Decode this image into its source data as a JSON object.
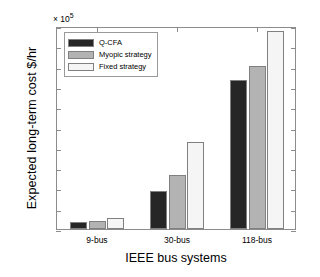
{
  "chart_data": {
    "type": "bar",
    "title": "",
    "xlabel": "IEEE bus systems",
    "ylabel": "Expected long-term cost $/hr",
    "y_exponent_label": "× 10",
    "y_exponent_value": "5",
    "y_scale_factor": 100000,
    "categories": [
      "9-bus",
      "30-bus",
      "118-bus"
    ],
    "ylim": [
      0,
      2
    ],
    "yticks": [
      0,
      0.2,
      0.4,
      0.6,
      0.8,
      1,
      1.2,
      1.4,
      1.6,
      1.8,
      2
    ],
    "ytick_labels": [
      "0",
      "0.2",
      "0.4",
      "0.6",
      "0.8",
      "1",
      "1.2",
      "1.4",
      "1.6",
      "1.8",
      "2"
    ],
    "grid": false,
    "legend_position": "upper left",
    "series": [
      {
        "name": "Q-CFA",
        "color": "#262626",
        "values": [
          0.07,
          0.375,
          1.47
        ]
      },
      {
        "name": "Myopic strategy",
        "color": "#b3b3b3",
        "values": [
          0.08,
          0.53,
          1.61
        ]
      },
      {
        "name": "Fixed strategy",
        "color": "#f5f5f5",
        "values": [
          0.11,
          0.86,
          1.95
        ]
      }
    ]
  },
  "legend": {
    "items": [
      {
        "label": "Q-CFA",
        "color": "#262626"
      },
      {
        "label": "Myopic strategy",
        "color": "#b3b3b3"
      },
      {
        "label": "Fixed strategy",
        "color": "#f5f5f5"
      }
    ]
  },
  "axes": {
    "x_title": "IEEE bus systems",
    "y_title": "Expected long-term cost $/hr",
    "exponent_prefix": "× 10",
    "exponent_power": "5"
  }
}
